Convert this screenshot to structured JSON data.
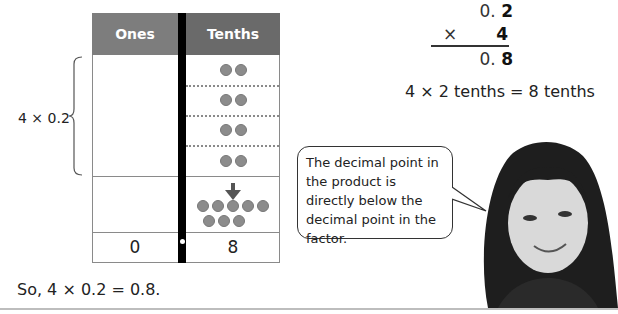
{
  "chart": {
    "headers": [
      "Ones",
      "Tenths"
    ],
    "groups_label": "4 × 0.2",
    "groups": [
      {
        "tenths_counters": 2
      },
      {
        "tenths_counters": 2
      },
      {
        "tenths_counters": 2
      },
      {
        "tenths_counters": 2
      }
    ],
    "combined_counters": 8,
    "result_row": {
      "ones": "0",
      "tenths": "8"
    }
  },
  "multiplication": {
    "line1_plain": "0. ",
    "line1_bold": "2",
    "operator": "×",
    "multiplier": "4",
    "result_plain": "0. ",
    "result_bold": "8"
  },
  "tenths_equation": "4 × 2 tenths = 8 tenths",
  "speech_bubble": "The decimal point in the product is directly below the decimal point in the factor.",
  "conclusion": "So, 4 × 0.2 = 0.8.",
  "colors": {
    "ones_header": "#7d7d7d",
    "tenths_header": "#6a6a6a",
    "counter": "#8c8c8c",
    "divider": "#000000"
  }
}
